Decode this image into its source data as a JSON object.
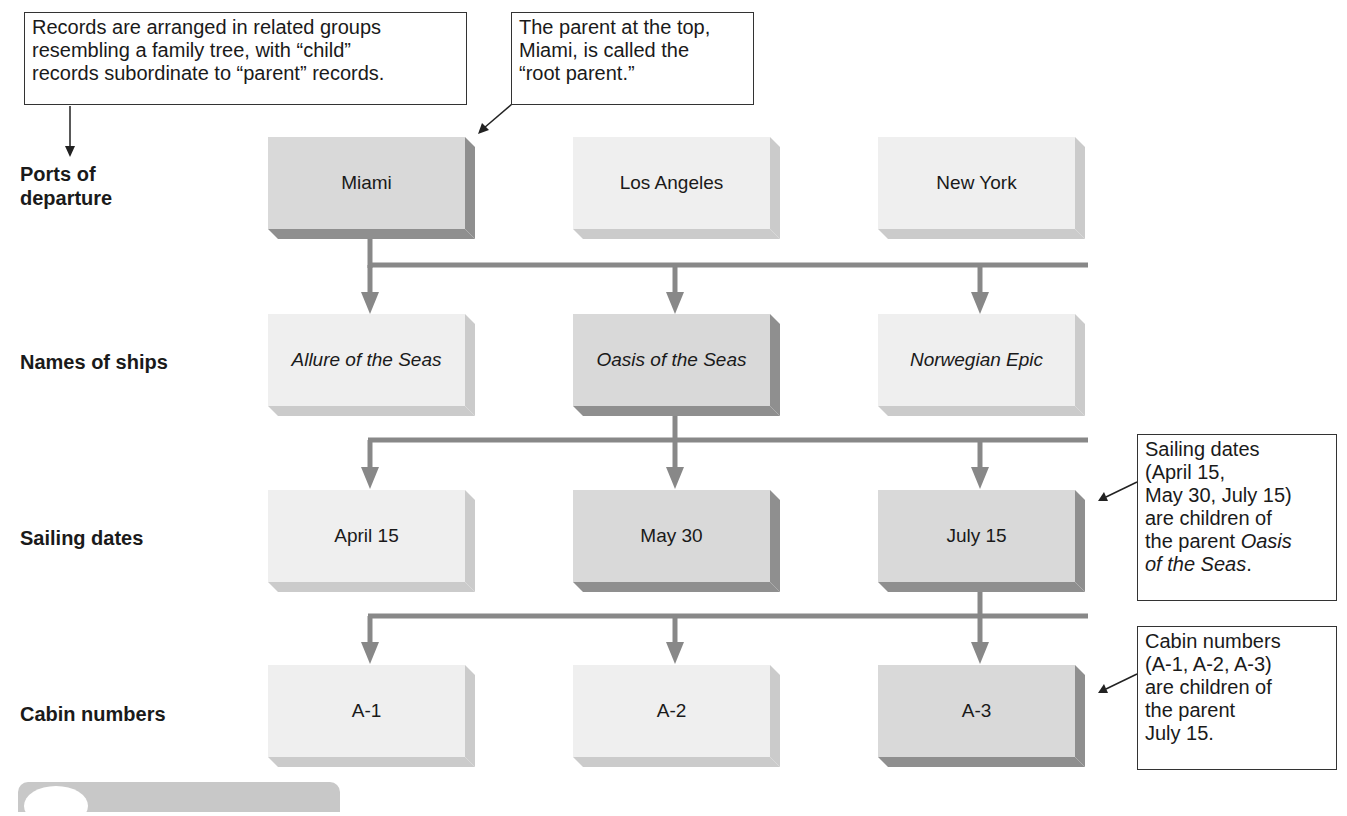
{
  "callouts": {
    "top_left": {
      "lines": [
        "Records are arranged in related groups",
        "resembling a family tree, with “child”",
        "records subordinate to “parent” records."
      ]
    },
    "top_middle": {
      "lines": [
        "The parent at the top,",
        "Miami, is called the",
        "“root parent.”"
      ]
    },
    "sailing": {
      "lines": [
        "Sailing dates",
        "(April 15,",
        "May 30, July 15)",
        "are children of",
        "the parent "
      ],
      "italic_a": "Oasis",
      "italic_b": "of the Seas",
      "end": "."
    },
    "cabin": {
      "lines": [
        "Cabin numbers",
        "(A-1, A-2, A-3)",
        "are children of",
        "the parent",
        "July 15."
      ]
    }
  },
  "row_labels": {
    "ports_line1": "Ports of",
    "ports_line2": "departure",
    "ships": "Names of ships",
    "dates": "Sailing dates",
    "cabins": "Cabin numbers"
  },
  "rows": {
    "ports": [
      "Miami",
      "Los Angeles",
      "New York"
    ],
    "ships": [
      "Allure of the Seas",
      "Oasis of the Seas",
      "Norwegian Epic"
    ],
    "dates": [
      "April 15",
      "May 30",
      "July 15"
    ],
    "cabins": [
      "A-1",
      "A-2",
      "A-3"
    ]
  },
  "highlighted": {
    "ports": "Miami",
    "ships": "Oasis of the Seas",
    "dates": [
      "May 30",
      "July 15"
    ],
    "cabins": "A-3"
  },
  "colors": {
    "light_box": "#efefef",
    "dark_box": "#d9d9d9",
    "connector": "#888888"
  }
}
